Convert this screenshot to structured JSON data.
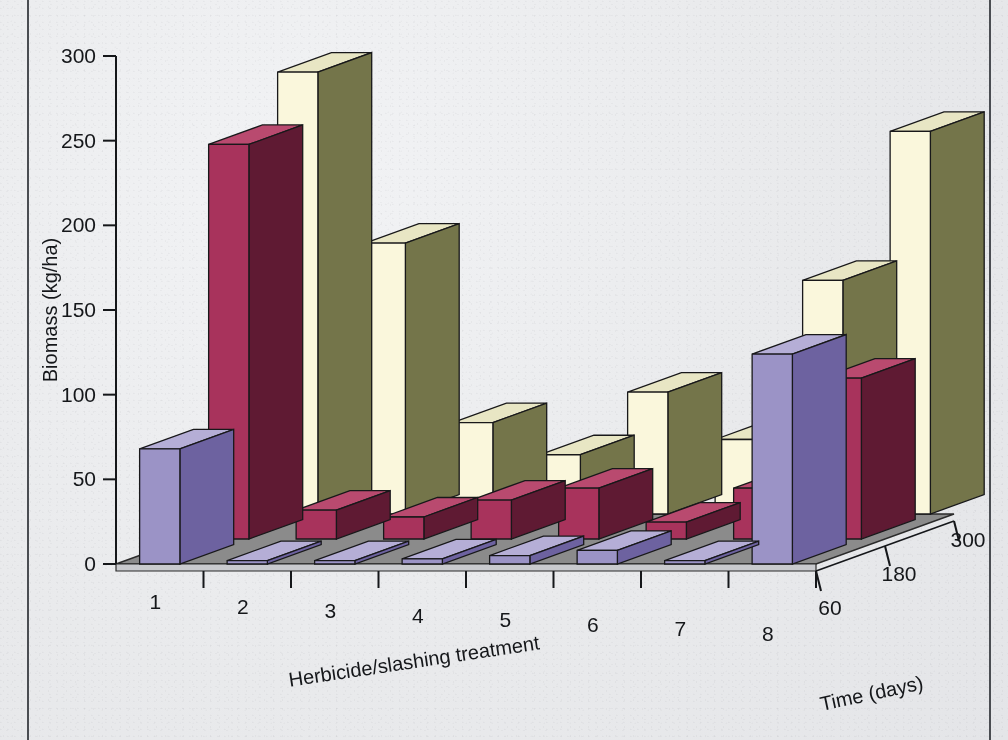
{
  "chart_data": {
    "type": "bar",
    "style": "3d-grouped-bar",
    "title": "",
    "xlabel": "Herbicide/slashing treatment",
    "ylabel": "Biomass (kg/ha)",
    "zlabel": "Time (days)",
    "categories": [
      "1",
      "2",
      "3",
      "4",
      "5",
      "6",
      "7",
      "8"
    ],
    "z_categories": [
      "60",
      "180",
      "300"
    ],
    "ylim": [
      0,
      300
    ],
    "yticks": [
      0,
      50,
      100,
      150,
      200,
      250,
      300
    ],
    "ytick_labels": [
      "0",
      "50",
      "100",
      "150",
      "200",
      "250",
      "300"
    ],
    "grid": false,
    "legend": "none",
    "series": [
      {
        "name": "60",
        "color": "#9b93c6",
        "side_color": "#6d62a0",
        "top_color": "#b5aed6",
        "values": [
          68,
          2,
          2,
          3,
          5,
          8,
          2,
          124
        ]
      },
      {
        "name": "180",
        "color": "#a8335c",
        "side_color": "#5f1a33",
        "top_color": "#b94a6f",
        "values": [
          233,
          17,
          13,
          23,
          30,
          10,
          30,
          95
        ]
      },
      {
        "name": "300",
        "color": "#faf7dc",
        "side_color": "#74754a",
        "top_color": "#e8e6c4",
        "values": [
          261,
          160,
          54,
          35,
          72,
          44,
          138,
          226
        ]
      }
    ],
    "floor_color": "#8b8b8b",
    "background_color": "#eceef0",
    "axis_color": "#15171a"
  },
  "axes": {
    "y_title": "Biomass (kg/ha)",
    "x_title": "Herbicide/slashing treatment",
    "z_title": "Time (days)",
    "y_ticks": [
      "300",
      "250",
      "200",
      "150",
      "100",
      "50",
      "0"
    ],
    "x_ticks": [
      "1",
      "2",
      "3",
      "4",
      "5",
      "6",
      "7",
      "8"
    ],
    "z_ticks": [
      "60",
      "180",
      "300"
    ]
  }
}
